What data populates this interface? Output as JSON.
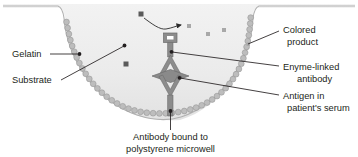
{
  "diagram": {
    "type": "labeled-biology-diagram",
    "background_color": "#ffffff",
    "well": {
      "fill_color": "#ececec",
      "outline_color": "#a9a9a9",
      "shape": "flared-rim U-shaped microwell cross-section"
    },
    "colors": {
      "text": "#231f20",
      "leader_line": "#231f20",
      "gelatin_bead": "#b8b8b8",
      "gelatin_bead_outline": "#8f8f8f",
      "antibody": "#8c8c8c",
      "antibody_outline": "#6e6e6e",
      "antigen": "#7d7d7d",
      "substrate_particle": "#5a5a5a",
      "product_particle": "#a6a6a6",
      "enzyme_box_fill": "#8c8c8c",
      "enzyme_box_center": "#ffffff"
    }
  },
  "labels": {
    "gelatin": {
      "text": "Gelatin",
      "x": 12,
      "y": 57
    },
    "substrate": {
      "text": "Substrate",
      "x": 12,
      "y": 83
    },
    "colored_product": {
      "line1": "Colored",
      "line2": "product",
      "x": 283,
      "y": 33
    },
    "enzyme_linked_antibody": {
      "line1": "Enyme-linked",
      "line2": "antibody",
      "x": 283,
      "y": 72
    },
    "antigen_in_serum": {
      "line1": "Antigen in",
      "line2": "patient's serum",
      "x": 283,
      "y": 101
    },
    "antibody_bound": {
      "line1": "Antibody bound to",
      "line2": "polystyrene microwell",
      "x": 179,
      "y": 136
    }
  },
  "particles": {
    "substrate": [
      {
        "x": 141,
        "y": 14,
        "size": 5
      },
      {
        "x": 126,
        "y": 64,
        "size": 5
      }
    ],
    "product": [
      {
        "x": 189,
        "y": 26,
        "size": 4
      },
      {
        "x": 208,
        "y": 34,
        "size": 4
      },
      {
        "x": 224,
        "y": 30,
        "size": 4
      },
      {
        "x": 248,
        "y": 44,
        "size": 3
      }
    ]
  },
  "structures": {
    "enzyme_box": {
      "x": 170,
      "y": 34,
      "w": 13,
      "h": 9
    },
    "reaction_arrow": {
      "from_x": 147,
      "from_y": 18,
      "to_x": 180,
      "to_y": 26
    },
    "antigen_diamond": {
      "cx": 170,
      "cy": 76
    },
    "bound_antibody_label_anchor": {
      "x": 170,
      "y": 125
    }
  }
}
